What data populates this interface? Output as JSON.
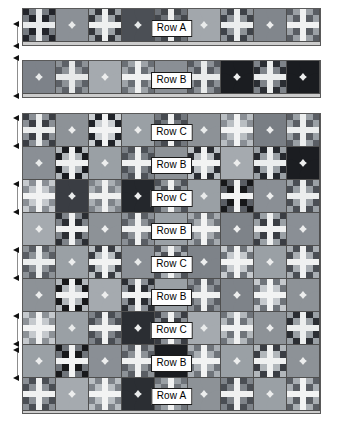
{
  "document": {
    "kind": "quilt-layout-diagram",
    "title": "Quilt Row Assembly Diagram",
    "columns": 9,
    "background_color": "#ffffff",
    "block_outline_color": "#4f4f4f",
    "sashing_color": "#cccccc"
  },
  "palette": {
    "black": "#17181a",
    "dark": "#3c3f44",
    "charcoal": "#54585e",
    "mid": "#6f747a",
    "gray": "#8b9096",
    "light_gray": "#a9aeb3",
    "pale": "#c7ccd0",
    "cream": "#e3e6e7",
    "white": "#f3f4f4"
  },
  "legend": {
    "block_types": [
      {
        "id": "curved",
        "name": "Drunkard's Path / Orange Peel block"
      },
      {
        "id": "cross",
        "name": "Nine-patch Cross block"
      }
    ]
  },
  "strips": [
    {
      "label": "Row A",
      "name": "row-a-strip",
      "blocks": [
        {
          "type": "cross",
          "colors": {
            "bg": "#22242a",
            "cross": "#e9ebec",
            "accent": "#767b81"
          }
        },
        {
          "type": "curved",
          "colors": {
            "bg": "#e8eaea",
            "corner": "#8b9096"
          }
        },
        {
          "type": "cross",
          "colors": {
            "bg": "#9aa0a5",
            "cross": "#eef0f0",
            "accent": "#33363b"
          }
        },
        {
          "type": "curved",
          "colors": {
            "bg": "#e5e8e8",
            "corner": "#4b4f55"
          }
        },
        {
          "type": "cross",
          "colors": {
            "bg": "#6c7177",
            "cross": "#edeeee",
            "accent": "#43474c"
          }
        },
        {
          "type": "curved",
          "colors": {
            "bg": "#e9ebeb",
            "corner": "#a2a7ac"
          }
        },
        {
          "type": "cross",
          "colors": {
            "bg": "#8e9398",
            "cross": "#eceeee",
            "accent": "#3f4349"
          }
        },
        {
          "type": "curved",
          "colors": {
            "bg": "#eceded",
            "corner": "#81868c"
          }
        },
        {
          "type": "cross",
          "colors": {
            "bg": "#595d63",
            "cross": "#f0f1f1",
            "accent": "#9ba0a5"
          }
        }
      ]
    },
    {
      "label": "Row B",
      "name": "row-b-strip",
      "blocks": [
        {
          "type": "curved",
          "colors": {
            "bg": "#e9ebeb",
            "corner": "#7d8289"
          }
        },
        {
          "type": "cross",
          "colors": {
            "bg": "#8d9297",
            "cross": "#e7e9e9",
            "accent": "#5d6167"
          }
        },
        {
          "type": "curved",
          "colors": {
            "bg": "#eceded",
            "corner": "#a5aaaf"
          }
        },
        {
          "type": "cross",
          "colors": {
            "bg": "#6a6f75",
            "cross": "#f0f1f1",
            "accent": "#9ea3a8"
          }
        },
        {
          "type": "curved",
          "colors": {
            "bg": "#e7e9e9",
            "corner": "#8a8f95"
          }
        },
        {
          "type": "cross",
          "colors": {
            "bg": "#565a60",
            "cross": "#e9ebeb",
            "accent": "#8b9096"
          }
        },
        {
          "type": "curved",
          "colors": {
            "bg": "#edeeee",
            "corner": "#1b1d21"
          }
        },
        {
          "type": "cross",
          "colors": {
            "bg": "#7e8389",
            "cross": "#eceeee",
            "accent": "#2b2e33"
          }
        },
        {
          "type": "curved",
          "colors": {
            "bg": "#eceded",
            "corner": "#1a1c20"
          }
        }
      ]
    }
  ],
  "main_grid": {
    "name": "quilt-main-grid",
    "rows": [
      {
        "label": "Row C",
        "blocks": [
          {
            "type": "cross",
            "colors": {
              "bg": "#3b3e44",
              "cross": "#eceeee",
              "accent": "#8a8f95"
            }
          },
          {
            "type": "curved",
            "colors": {
              "bg": "#edeeee",
              "corner": "#8d9297"
            }
          },
          {
            "type": "cross",
            "colors": {
              "bg": "#cbcfd2",
              "cross": "#f2f3f3",
              "accent": "#202328"
            }
          },
          {
            "type": "curved",
            "colors": {
              "bg": "#eceded",
              "corner": "#9aa0a5"
            }
          },
          {
            "type": "cross",
            "colors": {
              "bg": "#72777d",
              "cross": "#f0f1f1",
              "accent": "#464a50"
            }
          },
          {
            "type": "curved",
            "colors": {
              "bg": "#e9ebeb",
              "corner": "#8d9297"
            }
          },
          {
            "type": "cross",
            "colors": {
              "bg": "#b9bec2",
              "cross": "#f2f3f3",
              "accent": "#8a8f95"
            }
          },
          {
            "type": "curved",
            "colors": {
              "bg": "#eceded",
              "corner": "#797e84"
            }
          },
          {
            "type": "cross",
            "colors": {
              "bg": "#5a5e64",
              "cross": "#eceeee",
              "accent": "#9aa0a5"
            }
          }
        ]
      },
      {
        "label": "Row B",
        "blocks": [
          {
            "type": "curved",
            "colors": {
              "bg": "#e9ebeb",
              "corner": "#8a8f95"
            }
          },
          {
            "type": "cross",
            "colors": {
              "bg": "#b2b7bb",
              "cross": "#f0f1f1",
              "accent": "#1a1c20"
            }
          },
          {
            "type": "curved",
            "colors": {
              "bg": "#edeeee",
              "corner": "#9aa0a5"
            }
          },
          {
            "type": "cross",
            "colors": {
              "bg": "#7b8086",
              "cross": "#f0f1f1",
              "accent": "#4d5157"
            }
          },
          {
            "type": "curved",
            "colors": {
              "bg": "#eceded",
              "corner": "#8d9297"
            }
          },
          {
            "type": "cross",
            "colors": {
              "bg": "#b9bec2",
              "cross": "#f2f3f3",
              "accent": "#2a2d32"
            }
          },
          {
            "type": "curved",
            "colors": {
              "bg": "#edeeee",
              "corner": "#a5aaaf"
            }
          },
          {
            "type": "cross",
            "colors": {
              "bg": "#9aa0a5",
              "cross": "#eceeee",
              "accent": "#26292e"
            }
          },
          {
            "type": "curved",
            "colors": {
              "bg": "#eceded",
              "corner": "#1b1d21"
            }
          }
        ]
      },
      {
        "label": "Row C",
        "blocks": [
          {
            "type": "cross",
            "colors": {
              "bg": "#c5c9cd",
              "cross": "#f2f3f3",
              "accent": "#8a8f95"
            }
          },
          {
            "type": "curved",
            "colors": {
              "bg": "#e9ebeb",
              "corner": "#3a3d43"
            }
          },
          {
            "type": "cross",
            "colors": {
              "bg": "#7e8389",
              "cross": "#f0f1f1",
              "accent": "#a9aeb3"
            }
          },
          {
            "type": "curved",
            "colors": {
              "bg": "#edeeee",
              "corner": "#24272c"
            }
          },
          {
            "type": "cross",
            "colors": {
              "bg": "#4e5258",
              "cross": "#f0f1f1",
              "accent": "#8d9297"
            }
          },
          {
            "type": "curved",
            "colors": {
              "bg": "#e9ebeb",
              "corner": "#9aa0a5"
            }
          },
          {
            "type": "cross",
            "colors": {
              "bg": "#17181a",
              "cross": "#f2f3f3",
              "accent": "#5a5e64"
            }
          },
          {
            "type": "curved",
            "colors": {
              "bg": "#edeeee",
              "corner": "#8a8f95"
            }
          },
          {
            "type": "cross",
            "colors": {
              "bg": "#9aa0a5",
              "cross": "#eceeee",
              "accent": "#4a4e54"
            }
          }
        ]
      },
      {
        "label": "Row B",
        "blocks": [
          {
            "type": "curved",
            "colors": {
              "bg": "#eceded",
              "corner": "#a5aaaf"
            }
          },
          {
            "type": "cross",
            "colors": {
              "bg": "#2b2e33",
              "cross": "#f0f1f1",
              "accent": "#7e8389"
            }
          },
          {
            "type": "curved",
            "colors": {
              "bg": "#edeeee",
              "corner": "#8d9297"
            }
          },
          {
            "type": "cross",
            "colors": {
              "bg": "#8a8f95",
              "cross": "#f0f1f1",
              "accent": "#5a5e64"
            }
          },
          {
            "type": "curved",
            "colors": {
              "bg": "#e9ebeb",
              "corner": "#9aa0a5"
            }
          },
          {
            "type": "cross",
            "colors": {
              "bg": "#a5aaaf",
              "cross": "#f2f3f3",
              "accent": "#6f747a"
            }
          },
          {
            "type": "curved",
            "colors": {
              "bg": "#edeeee",
              "corner": "#7e8389"
            }
          },
          {
            "type": "cross",
            "colors": {
              "bg": "#3a3d43",
              "cross": "#f0f1f1",
              "accent": "#9aa0a5"
            }
          },
          {
            "type": "curved",
            "colors": {
              "bg": "#eceded",
              "corner": "#8a8f95"
            }
          }
        ]
      },
      {
        "label": "Row C",
        "blocks": [
          {
            "type": "cross",
            "colors": {
              "bg": "#8d9297",
              "cross": "#eceeee",
              "accent": "#5a5e64"
            }
          },
          {
            "type": "curved",
            "colors": {
              "bg": "#edeeee",
              "corner": "#9aa0a5"
            }
          },
          {
            "type": "cross",
            "colors": {
              "bg": "#b9bec2",
              "cross": "#f2f3f3",
              "accent": "#3a3d43"
            }
          },
          {
            "type": "curved",
            "colors": {
              "bg": "#e9ebeb",
              "corner": "#8a8f95"
            }
          },
          {
            "type": "cross",
            "colors": {
              "bg": "#4e5258",
              "cross": "#f0f1f1",
              "accent": "#a5aaaf"
            }
          },
          {
            "type": "curved",
            "colors": {
              "bg": "#edeeee",
              "corner": "#7e8389"
            }
          },
          {
            "type": "cross",
            "colors": {
              "bg": "#c5c9cd",
              "cross": "#f2f3f3",
              "accent": "#6f747a"
            }
          },
          {
            "type": "curved",
            "colors": {
              "bg": "#eceded",
              "corner": "#9aa0a5"
            }
          },
          {
            "type": "cross",
            "colors": {
              "bg": "#a9aeb3",
              "cross": "#f0f1f1",
              "accent": "#4a4e54"
            }
          }
        ]
      },
      {
        "label": "Row B",
        "blocks": [
          {
            "type": "curved",
            "colors": {
              "bg": "#eceded",
              "corner": "#8d9297"
            }
          },
          {
            "type": "cross",
            "colors": {
              "bg": "#b2b7bb",
              "cross": "#f0f1f1",
              "accent": "#17181a"
            }
          },
          {
            "type": "curved",
            "colors": {
              "bg": "#edeeee",
              "corner": "#a5aaaf"
            }
          },
          {
            "type": "cross",
            "colors": {
              "bg": "#2b2e33",
              "cross": "#f2f3f3",
              "accent": "#8a8f95"
            }
          },
          {
            "type": "curved",
            "colors": {
              "bg": "#e9ebeb",
              "corner": "#9aa0a5"
            }
          },
          {
            "type": "cross",
            "colors": {
              "bg": "#8a8f95",
              "cross": "#f0f1f1",
              "accent": "#5a5e64"
            }
          },
          {
            "type": "curved",
            "colors": {
              "bg": "#edeeee",
              "corner": "#7e8389"
            }
          },
          {
            "type": "cross",
            "colors": {
              "bg": "#c5c9cd",
              "cross": "#f2f3f3",
              "accent": "#6f747a"
            }
          },
          {
            "type": "curved",
            "colors": {
              "bg": "#eceded",
              "corner": "#8d9297"
            }
          }
        ]
      },
      {
        "label": "Row C",
        "blocks": [
          {
            "type": "cross",
            "colors": {
              "bg": "#c5c9cd",
              "cross": "#f2f3f3",
              "accent": "#8d9297"
            }
          },
          {
            "type": "curved",
            "colors": {
              "bg": "#e9ebeb",
              "corner": "#9aa0a5"
            }
          },
          {
            "type": "cross",
            "colors": {
              "bg": "#7e8389",
              "cross": "#f0f1f1",
              "accent": "#4a4e54"
            }
          },
          {
            "type": "curved",
            "colors": {
              "bg": "#edeeee",
              "corner": "#2b2e33"
            }
          },
          {
            "type": "cross",
            "colors": {
              "bg": "#3a3d43",
              "cross": "#f2f3f3",
              "accent": "#8a8f95"
            }
          },
          {
            "type": "curved",
            "colors": {
              "bg": "#e9ebeb",
              "corner": "#a5aaaf"
            }
          },
          {
            "type": "cross",
            "colors": {
              "bg": "#6f747a",
              "cross": "#f0f1f1",
              "accent": "#b2b7bb"
            }
          },
          {
            "type": "curved",
            "colors": {
              "bg": "#edeeee",
              "corner": "#8d9297"
            }
          },
          {
            "type": "cross",
            "colors": {
              "bg": "#9aa0a5",
              "cross": "#eceeee",
              "accent": "#2b2e33"
            }
          }
        ]
      },
      {
        "label": "Row B",
        "blocks": [
          {
            "type": "curved",
            "colors": {
              "bg": "#eceded",
              "corner": "#9aa0a5"
            }
          },
          {
            "type": "cross",
            "colors": {
              "bg": "#17181a",
              "cross": "#f2f3f3",
              "accent": "#6f747a"
            }
          },
          {
            "type": "curved",
            "colors": {
              "bg": "#edeeee",
              "corner": "#8a8f95"
            }
          },
          {
            "type": "cross",
            "colors": {
              "bg": "#8d9297",
              "cross": "#f0f1f1",
              "accent": "#5a5e64"
            }
          },
          {
            "type": "curved",
            "colors": {
              "bg": "#e9ebeb",
              "corner": "#1b1d21"
            }
          },
          {
            "type": "cross",
            "colors": {
              "bg": "#a9aeb3",
              "cross": "#f2f3f3",
              "accent": "#6f747a"
            }
          },
          {
            "type": "curved",
            "colors": {
              "bg": "#edeeee",
              "corner": "#9aa0a5"
            }
          },
          {
            "type": "cross",
            "colors": {
              "bg": "#b2b7bb",
              "cross": "#f0f1f1",
              "accent": "#3a3d43"
            }
          },
          {
            "type": "curved",
            "colors": {
              "bg": "#eceded",
              "corner": "#8d9297"
            }
          }
        ]
      },
      {
        "label": "Row A",
        "blocks": [
          {
            "type": "cross",
            "colors": {
              "bg": "#8a8f95",
              "cross": "#f0f1f1",
              "accent": "#4a4e54"
            }
          },
          {
            "type": "curved",
            "colors": {
              "bg": "#edeeee",
              "corner": "#a5aaaf"
            }
          },
          {
            "type": "cross",
            "colors": {
              "bg": "#b9bec2",
              "cross": "#f2f3f3",
              "accent": "#7e8389"
            }
          },
          {
            "type": "curved",
            "colors": {
              "bg": "#e9ebeb",
              "corner": "#2b2e33"
            }
          },
          {
            "type": "cross",
            "colors": {
              "bg": "#6f747a",
              "cross": "#f0f1f1",
              "accent": "#9aa0a5"
            }
          },
          {
            "type": "curved",
            "colors": {
              "bg": "#edeeee",
              "corner": "#8d9297"
            }
          },
          {
            "type": "cross",
            "colors": {
              "bg": "#7e8389",
              "cross": "#f0f1f1",
              "accent": "#4a4e54"
            }
          },
          {
            "type": "curved",
            "colors": {
              "bg": "#eceded",
              "corner": "#9aa0a5"
            }
          },
          {
            "type": "cross",
            "colors": {
              "bg": "#5a5e64",
              "cross": "#f2f3f3",
              "accent": "#a9aeb3"
            }
          }
        ]
      }
    ]
  },
  "measures": [
    {
      "name": "measure-strip-a",
      "top": 22,
      "height": 26
    },
    {
      "name": "measure-strip-b",
      "top": 56,
      "height": 42
    },
    {
      "name": "measure-grid-1",
      "top": 116,
      "height": 32
    },
    {
      "name": "measure-grid-2",
      "top": 182,
      "height": 32
    },
    {
      "name": "measure-grid-3",
      "top": 248,
      "height": 32
    },
    {
      "name": "measure-grid-4",
      "top": 314,
      "height": 32
    },
    {
      "name": "measure-grid-5",
      "top": 348,
      "height": 32
    }
  ]
}
